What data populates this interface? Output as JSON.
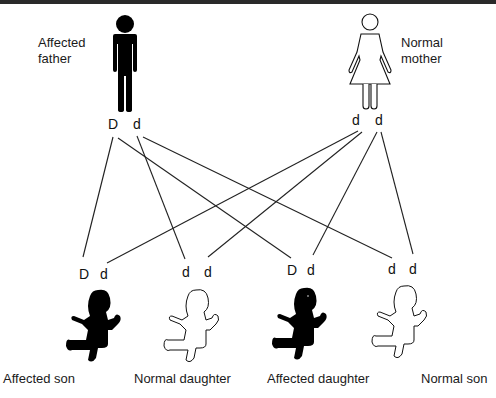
{
  "parents": {
    "father": {
      "label_line1": "Affected",
      "label_line2": "father",
      "alleles": [
        "D",
        "d"
      ],
      "affected": true
    },
    "mother": {
      "label_line1": "Normal",
      "label_line2": "mother",
      "alleles": [
        "d",
        "d"
      ],
      "affected": false
    }
  },
  "offspring": [
    {
      "label": "Affected son",
      "alleles": [
        "D",
        "d"
      ],
      "affected": true
    },
    {
      "label": "Normal daughter",
      "alleles": [
        "d",
        "d"
      ],
      "affected": false
    },
    {
      "label": "Affected daughter",
      "alleles": [
        "D",
        "d"
      ],
      "affected": true
    },
    {
      "label": "Normal son",
      "alleles": [
        "d",
        "d"
      ],
      "affected": false
    }
  ],
  "colors": {
    "affected": "#000000",
    "normal": "#ffffff",
    "line": "#222222",
    "topbar": "#2a2a2a"
  }
}
